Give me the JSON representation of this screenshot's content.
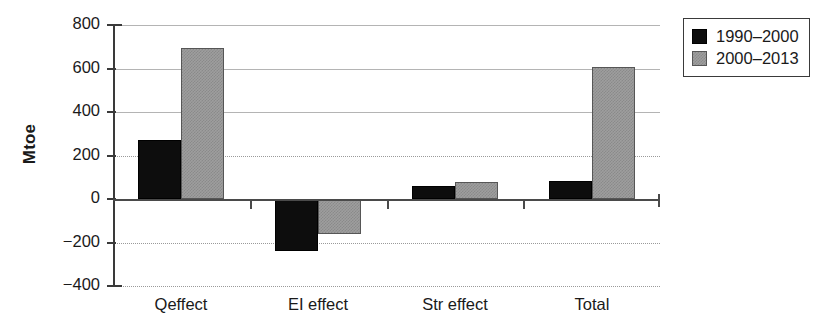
{
  "chart_data": {
    "type": "bar",
    "title": "",
    "xlabel": "",
    "ylabel": "Mtoe",
    "categories": [
      "Qeffect",
      "EI effect",
      "Str effect",
      "Total"
    ],
    "series": [
      {
        "name": "1990–2000",
        "color": "#0d0d0d",
        "values": [
          270,
          -240,
          60,
          85
        ]
      },
      {
        "name": "2000–2013",
        "color": "#9e9e9e",
        "values": [
          693,
          -160,
          78,
          605
        ]
      }
    ],
    "ylim": [
      -400,
      800
    ],
    "yticks": [
      800,
      600,
      400,
      200,
      0,
      -200,
      -400
    ],
    "ytick_labels": [
      "800",
      "600",
      "400",
      "200",
      "0",
      "−200",
      "−400"
    ],
    "grid": true,
    "gridlines_style": [
      "solid",
      "solid",
      "solid",
      "dotted",
      "zero",
      "dotted",
      "dotted"
    ],
    "legend_position": "top-right",
    "legend_entries": [
      "1990–2000",
      "2000–2013"
    ]
  },
  "axis": {
    "y_title": "Mtoe"
  }
}
